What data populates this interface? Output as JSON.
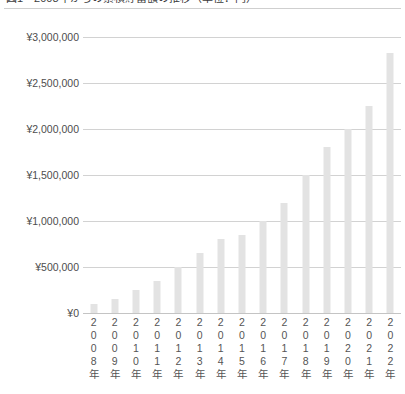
{
  "chart_title": "図1　2008年からの累積貯蓄額の推移（単位：円）",
  "currency_symbol": "¥",
  "colors": {
    "bar": "#e3e3e3",
    "gridline": "#d2d2d2",
    "baseline": "#c4c4c4",
    "title_rule": "#cfcfcf",
    "axis_text": "#4d4d4d"
  },
  "y_axis": {
    "ticks": [
      "¥3,000,000",
      "¥2,500,000",
      "¥2,000,000",
      "¥1,500,000",
      "¥1,000,000",
      "¥500,000",
      "¥0"
    ]
  },
  "x_axis": {
    "tick_suffix": "年",
    "ticks": [
      "2008年",
      "2009年",
      "2010年",
      "2011年",
      "2012年",
      "2013年",
      "2014年",
      "2015年",
      "2016年",
      "2017年",
      "2018年",
      "2019年",
      "2020年",
      "2021年",
      "2022年"
    ]
  },
  "chart_data": {
    "type": "bar",
    "title": "図1　2008年からの累積貯蓄額の推移（単位：円）",
    "xlabel": "",
    "ylabel": "",
    "ylim": [
      0,
      3000000
    ],
    "ytick_step": 500000,
    "grid": true,
    "legend": false,
    "categories": [
      "2008年",
      "2009年",
      "2010年",
      "2011年",
      "2012年",
      "2013年",
      "2014年",
      "2015年",
      "2016年",
      "2017年",
      "2018年",
      "2019年",
      "2020年",
      "2021年",
      "2022年"
    ],
    "values": [
      100000,
      150000,
      250000,
      350000,
      500000,
      650000,
      800000,
      850000,
      1000000,
      1200000,
      1500000,
      1800000,
      2000000,
      2250000,
      2830000
    ]
  }
}
